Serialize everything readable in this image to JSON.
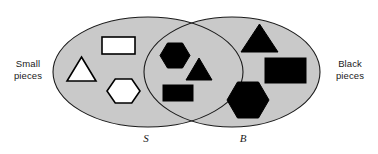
{
  "figure": {
    "type": "venn-diagram",
    "width": 378,
    "height": 154,
    "background_color": "#ffffff"
  },
  "colors": {
    "ellipse_fill": "#c9c9c9",
    "ellipse_stroke": "#1a1a1a",
    "shape_black": "#000000",
    "shape_white": "#ffffff",
    "shape_outline": "#000000",
    "text": "#1a1a1a"
  },
  "labels": {
    "left_label": "Small\npieces",
    "right_label": "Black\npieces",
    "set_left": "S",
    "set_right": "B"
  },
  "sets": {
    "left": {
      "name": "S",
      "description": "Small pieces",
      "cx": 148,
      "cy": 72,
      "rx": 95,
      "ry": 55
    },
    "right": {
      "name": "B",
      "description": "Black pieces",
      "cx": 232,
      "cy": 72,
      "rx": 88,
      "ry": 55
    }
  },
  "regions": [
    {
      "id": "left-only",
      "set": "S",
      "description": "Small pieces that are not black",
      "count": 3,
      "shapes": [
        {
          "shape": "rectangle",
          "fill": "white",
          "size": "small",
          "x": 102,
          "y": 37,
          "w": 33,
          "h": 17
        },
        {
          "shape": "triangle",
          "fill": "white",
          "size": "small",
          "x": 67,
          "y": 57,
          "w": 29,
          "h": 24
        },
        {
          "shape": "hexagon",
          "fill": "white",
          "size": "small",
          "x": 107,
          "y": 79,
          "w": 33,
          "h": 24
        }
      ]
    },
    {
      "id": "intersection",
      "set": "S and B",
      "description": "Small pieces that are also black",
      "count": 3,
      "shapes": [
        {
          "shape": "hexagon",
          "fill": "black",
          "size": "small",
          "x": 160,
          "y": 43,
          "w": 30,
          "h": 25
        },
        {
          "shape": "triangle",
          "fill": "black",
          "size": "small",
          "x": 186,
          "y": 58,
          "w": 26,
          "h": 22
        },
        {
          "shape": "rectangle",
          "fill": "black",
          "size": "small",
          "x": 163,
          "y": 85,
          "w": 30,
          "h": 16
        }
      ]
    },
    {
      "id": "right-only",
      "set": "B",
      "description": "Black pieces that are not small",
      "count": 3,
      "shapes": [
        {
          "shape": "triangle",
          "fill": "black",
          "size": "large",
          "x": 241,
          "y": 24,
          "w": 37,
          "h": 28
        },
        {
          "shape": "rectangle",
          "fill": "black",
          "size": "large",
          "x": 265,
          "y": 58,
          "w": 41,
          "h": 25
        },
        {
          "shape": "hexagon",
          "fill": "black",
          "size": "large",
          "x": 227,
          "y": 82,
          "w": 42,
          "h": 36
        }
      ]
    }
  ]
}
